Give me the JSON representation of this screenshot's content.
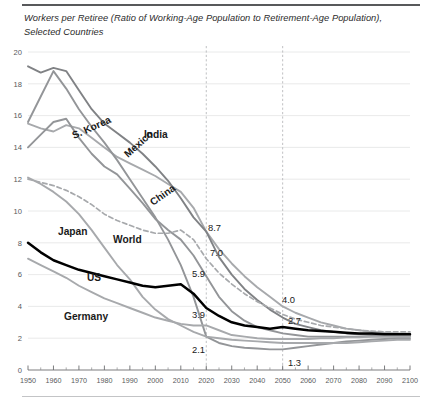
{
  "chart_data": {
    "type": "line",
    "title": "Workers per Retiree (Ratio of Working-Age Population to Retirement-Age Population), Selected Countries",
    "xlabel": "",
    "ylabel": "",
    "xlim": [
      1950,
      2100
    ],
    "ylim": [
      0,
      20
    ],
    "yticks": [
      0,
      2,
      4,
      6,
      8,
      10,
      12,
      14,
      16,
      18,
      20
    ],
    "xticks": [
      1950,
      1960,
      1970,
      1980,
      1990,
      2000,
      2010,
      2020,
      2030,
      2040,
      2050,
      2060,
      2070,
      2080,
      2090,
      2100
    ],
    "grid": true,
    "legend_position": "inline-labels",
    "reference_lines": [
      {
        "name": "year-2020-guide",
        "x": 2020
      },
      {
        "name": "year-2050-guide",
        "x": 2050
      }
    ],
    "x": [
      1950,
      1955,
      1960,
      1965,
      1970,
      1975,
      1980,
      1985,
      1990,
      1995,
      2000,
      2005,
      2010,
      2015,
      2020,
      2025,
      2030,
      2035,
      2040,
      2045,
      2050,
      2055,
      2060,
      2065,
      2070,
      2075,
      2080,
      2085,
      2090,
      2095,
      2100
    ],
    "series": [
      {
        "name": "India",
        "color": "#a7a9ac",
        "style": "solid",
        "width": 1.9,
        "values": [
          15.5,
          15.2,
          15.0,
          15.4,
          15.2,
          14.6,
          14.0,
          13.4,
          13.0,
          12.6,
          12.2,
          11.7,
          11.2,
          10.2,
          8.7,
          7.6,
          6.7,
          5.9,
          5.2,
          4.6,
          4.0,
          3.6,
          3.3,
          3.0,
          2.8,
          2.6,
          2.5,
          2.4,
          2.35,
          2.3,
          2.3
        ]
      },
      {
        "name": "Mexico",
        "color": "#808285",
        "style": "solid",
        "width": 1.9,
        "values": [
          19.1,
          18.7,
          19.0,
          18.8,
          17.6,
          16.4,
          15.5,
          14.9,
          14.3,
          13.6,
          12.8,
          11.9,
          10.8,
          9.6,
          8.7,
          7.1,
          6.0,
          5.1,
          4.4,
          3.8,
          3.3,
          2.9,
          2.7,
          2.5,
          2.4,
          2.3,
          2.25,
          2.2,
          2.2,
          2.15,
          2.15
        ]
      },
      {
        "name": "China",
        "color": "#939598",
        "style": "solid",
        "width": 1.9,
        "values": [
          14.0,
          14.8,
          15.6,
          15.8,
          14.6,
          13.6,
          12.8,
          12.3,
          11.4,
          10.5,
          9.5,
          8.8,
          8.2,
          7.2,
          5.9,
          4.6,
          3.7,
          3.1,
          2.7,
          2.5,
          2.3,
          2.2,
          2.1,
          2.1,
          2.1,
          2.1,
          2.1,
          2.1,
          2.1,
          2.1,
          2.1
        ]
      },
      {
        "name": "S. Korea",
        "color": "#939598",
        "style": "solid",
        "width": 1.9,
        "values": [
          15.6,
          17.2,
          18.8,
          17.7,
          16.4,
          15.3,
          14.3,
          13.2,
          12.0,
          10.8,
          9.6,
          8.2,
          6.6,
          4.6,
          2.1,
          1.7,
          1.5,
          1.4,
          1.35,
          1.3,
          1.3,
          1.4,
          1.5,
          1.6,
          1.7,
          1.8,
          1.85,
          1.9,
          1.95,
          2.0,
          2.0
        ]
      },
      {
        "name": "World",
        "color": "#a7a9ac",
        "style": "dashed",
        "width": 1.7,
        "values": [
          12.0,
          11.8,
          11.6,
          11.3,
          10.9,
          10.4,
          9.8,
          9.4,
          9.1,
          8.8,
          8.6,
          8.6,
          8.8,
          8.2,
          7.0,
          6.1,
          5.4,
          4.8,
          4.3,
          3.9,
          3.5,
          3.2,
          3.0,
          2.8,
          2.7,
          2.6,
          2.5,
          2.45,
          2.4,
          2.4,
          2.4
        ]
      },
      {
        "name": "Japan",
        "color": "#a7a9ac",
        "style": "solid",
        "width": 1.9,
        "values": [
          12.1,
          11.7,
          11.2,
          10.6,
          9.8,
          8.8,
          7.7,
          6.6,
          5.7,
          4.6,
          3.8,
          3.2,
          2.8,
          2.4,
          2.1,
          2.0,
          1.9,
          1.85,
          1.8,
          1.75,
          1.7,
          1.7,
          1.7,
          1.7,
          1.7,
          1.7,
          1.75,
          1.8,
          1.85,
          1.9,
          1.9
        ]
      },
      {
        "name": "US",
        "color": "#000000",
        "style": "solid",
        "width": 2.5,
        "values": [
          8.0,
          7.4,
          6.9,
          6.6,
          6.3,
          6.1,
          5.9,
          5.7,
          5.5,
          5.3,
          5.2,
          5.3,
          5.4,
          4.8,
          3.9,
          3.4,
          3.0,
          2.8,
          2.7,
          2.6,
          2.7,
          2.6,
          2.5,
          2.45,
          2.4,
          2.35,
          2.3,
          2.3,
          2.25,
          2.25,
          2.25
        ]
      },
      {
        "name": "Germany",
        "color": "#a7a9ac",
        "style": "solid",
        "width": 1.9,
        "values": [
          7.0,
          6.6,
          6.2,
          5.8,
          5.3,
          4.9,
          4.5,
          4.2,
          3.9,
          3.6,
          3.3,
          3.1,
          2.9,
          2.8,
          2.8,
          2.5,
          2.2,
          2.1,
          2.0,
          1.95,
          1.95,
          1.95,
          1.95,
          2.0,
          2.0,
          2.05,
          2.05,
          2.1,
          2.1,
          2.1,
          2.1
        ]
      }
    ],
    "series_labels": [
      {
        "name": "S. Korea",
        "x": 74,
        "y": 139,
        "rotate": -24
      },
      {
        "name": "India",
        "x": 144,
        "y": 138,
        "rotate": 0
      },
      {
        "name": "Mexico",
        "x": 128,
        "y": 158,
        "rotate": -42
      },
      {
        "name": "China",
        "x": 153,
        "y": 206,
        "rotate": -35
      },
      {
        "name": "Japan",
        "x": 58,
        "y": 235,
        "rotate": 0
      },
      {
        "name": "World",
        "x": 113,
        "y": 243,
        "rotate": 0
      },
      {
        "name": "US",
        "x": 87,
        "y": 281,
        "rotate": 0
      },
      {
        "name": "Germany",
        "x": 64,
        "y": 320,
        "rotate": 0
      }
    ],
    "annotations": [
      {
        "text": "8.7",
        "x": 208,
        "y": 231,
        "series": "India",
        "year": 2020,
        "value": 8.7
      },
      {
        "text": "7.0",
        "x": 210,
        "y": 256,
        "series": "World",
        "year": 2020,
        "value": 7.0
      },
      {
        "text": "5.9",
        "x": 192,
        "y": 277,
        "series": "China",
        "year": 2020,
        "value": 5.9
      },
      {
        "text": "3.9",
        "x": 192,
        "y": 318,
        "series": "US",
        "year": 2020,
        "value": 3.9
      },
      {
        "text": "2.1",
        "x": 192,
        "y": 353,
        "series": "S. Korea",
        "year": 2020,
        "value": 2.1
      },
      {
        "text": "4.0",
        "x": 282,
        "y": 303,
        "series": "India",
        "year": 2050,
        "value": 4.0
      },
      {
        "text": "2.7",
        "x": 288,
        "y": 324,
        "series": "US",
        "year": 2050,
        "value": 2.7
      },
      {
        "text": "1.3",
        "x": 288,
        "y": 366,
        "series": "S. Korea",
        "year": 2050,
        "value": 1.3
      }
    ]
  }
}
